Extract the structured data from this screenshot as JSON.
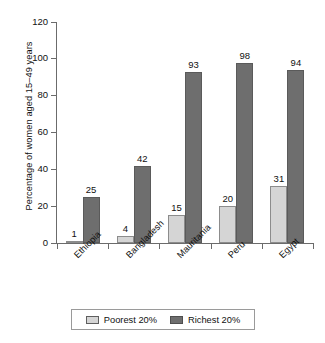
{
  "chart_data": {
    "type": "bar",
    "title": "",
    "subtitle": "",
    "xlabel": "",
    "ylabel": "Percentage of women aged 15–49 years",
    "ylim": [
      0,
      120
    ],
    "yticks": [
      0,
      20,
      40,
      60,
      80,
      100,
      120
    ],
    "grid": false,
    "legend_position": "bottom",
    "categories": [
      "Ethiopia",
      "Bangladesh",
      "Mauritania",
      "Peru",
      "Egypt"
    ],
    "series": [
      {
        "name": "Poorest 20%",
        "color": "#d5d5d5",
        "values": [
          1,
          4,
          15,
          20,
          31
        ]
      },
      {
        "name": "Richest 20%",
        "color": "#6e6e6e",
        "values": [
          25,
          42,
          93,
          98,
          94
        ]
      }
    ],
    "data_labels": {
      "poorest": [
        "1",
        "4",
        "15",
        "20",
        "31"
      ],
      "richest": [
        "25",
        "42",
        "93",
        "98",
        "94"
      ]
    },
    "ytick_labels": [
      "0",
      "20",
      "40",
      "60",
      "80",
      "100",
      "120"
    ]
  },
  "legend": {
    "items": [
      {
        "label": "Poorest 20%",
        "color": "#d5d5d5"
      },
      {
        "label": "Richest 20%",
        "color": "#6e6e6e"
      }
    ]
  }
}
